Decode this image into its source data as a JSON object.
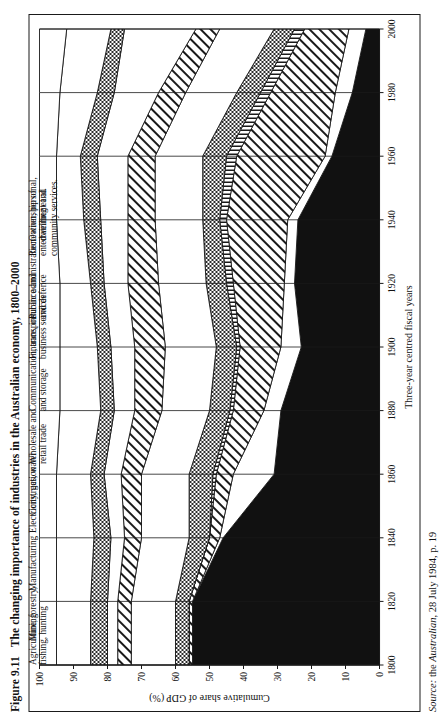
{
  "figure": {
    "number": "Figure 9.11",
    "title": "The changing importance of industries in the Australian economy, 1800–2000"
  },
  "source": {
    "label": "Source:",
    "lead": "the",
    "publication": "Australian",
    "rest": ", 28 July 1984, p. 19"
  },
  "axes": {
    "y_title": "Cumulative share of GDP (%)",
    "x_title": "Three-year centred fiscal years",
    "y_ticks": [
      "100",
      "90",
      "80",
      "70",
      "60",
      "50",
      "40",
      "30",
      "20",
      "10",
      "0"
    ],
    "x_ticks": [
      "1800",
      "1820",
      "1840",
      "1860",
      "1880",
      "1900",
      "1920",
      "1940",
      "1960",
      "1980",
      "2000"
    ]
  },
  "legend": [
    {
      "label": "Ownership of\ndwelling et al."
    },
    {
      "label": "Recreation, personal,\nentertainment and\ncommunity services."
    },
    {
      "label": "Public administration\nand defence"
    },
    {
      "label": "Finance, insurance and\nbusiness services"
    },
    {
      "label": "Communication, transport\nand storage"
    },
    {
      "label": "Wholesale and\nretail trade"
    },
    {
      "label": "Construction"
    },
    {
      "label": "Electricity, gas, water"
    },
    {
      "label": "Manufacturing"
    },
    {
      "label": "Mining"
    },
    {
      "label": "Agriculture, forestry,\nfishing, hunting"
    }
  ],
  "chart_data": {
    "type": "area",
    "title": "The changing importance of industries in the Australian economy, 1800–2000",
    "xlabel": "Three-year centred fiscal years",
    "ylabel": "Cumulative share of GDP (%)",
    "ylim": [
      0,
      100
    ],
    "grid": false,
    "legend_position": "top (band callouts)",
    "stacked": true,
    "note": "Values are percentage shares of GDP; they stack from 0 at the bottom (Agriculture) to 100 at the top (Ownership of dwelling).",
    "x": [
      1800,
      1820,
      1840,
      1860,
      1880,
      1900,
      1920,
      1940,
      1960,
      1980,
      2000
    ],
    "series": [
      {
        "name": "Agriculture, forestry, fishing, hunting",
        "fill": "black",
        "values": [
          55,
          55,
          46,
          31,
          29,
          23,
          25,
          24,
          14,
          8,
          4
        ]
      },
      {
        "name": "Mining",
        "fill": "white",
        "values": [
          0,
          0,
          1,
          12,
          5,
          6,
          3,
          3,
          2,
          5,
          5
        ]
      },
      {
        "name": "Manufacturing",
        "fill": "diagonal-hatch",
        "values": [
          1,
          1,
          3,
          5,
          9,
          12,
          15,
          18,
          26,
          19,
          13
        ]
      },
      {
        "name": "Electricity, gas, water",
        "fill": "fine-vertical-hatch",
        "values": [
          0,
          0,
          0,
          1,
          1,
          1,
          2,
          2,
          3,
          3,
          3
        ]
      },
      {
        "name": "Construction",
        "fill": "dark-stipple",
        "values": [
          4,
          4,
          6,
          7,
          6,
          6,
          6,
          5,
          7,
          7,
          6
        ]
      },
      {
        "name": "Wholesale and retail trade",
        "fill": "white",
        "values": [
          13,
          13,
          14,
          14,
          14,
          15,
          14,
          14,
          14,
          15,
          16
        ]
      },
      {
        "name": "Communication, transport and storage",
        "fill": "diagonal-hatch",
        "values": [
          4,
          4,
          5,
          6,
          8,
          9,
          9,
          8,
          8,
          8,
          7
        ]
      },
      {
        "name": "Finance, insurance and business services",
        "fill": "white",
        "values": [
          3,
          3,
          4,
          5,
          6,
          7,
          7,
          8,
          9,
          13,
          21
        ]
      },
      {
        "name": "Public administration and defence",
        "fill": "dark-stipple",
        "values": [
          5,
          5,
          5,
          4,
          4,
          4,
          4,
          5,
          5,
          5,
          4
        ]
      },
      {
        "name": "Recreation, personal, entertainment and community services.",
        "fill": "white",
        "values": [
          10,
          10,
          11,
          10,
          12,
          11,
          9,
          8,
          7,
          11,
          13
        ]
      },
      {
        "name": "Ownership of dwelling et al.",
        "fill": "white",
        "values": [
          5,
          5,
          5,
          5,
          6,
          6,
          6,
          5,
          5,
          6,
          8
        ]
      }
    ]
  }
}
